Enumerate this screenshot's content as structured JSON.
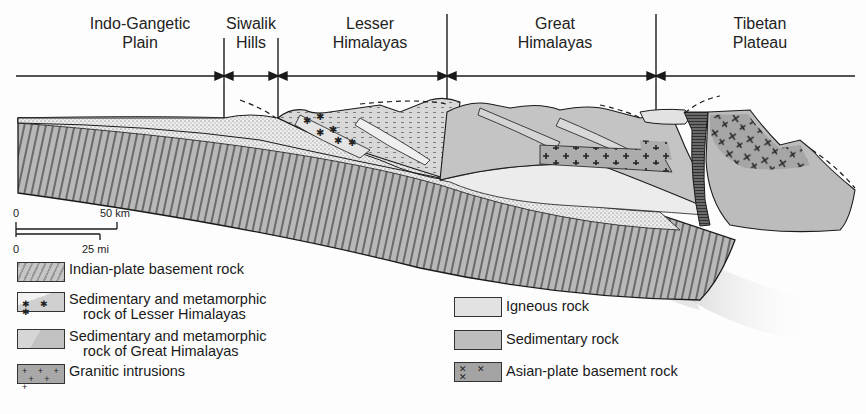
{
  "title_fragment": "Himalayan cross-section (title cut off at top edge)",
  "regions": [
    {
      "line1": "Indo-Gangetic",
      "line2": "Plain"
    },
    {
      "line1": "Siwalik",
      "line2": "Hills"
    },
    {
      "line1": "Lesser",
      "line2": "Himalayas"
    },
    {
      "line1": "Great",
      "line2": "Himalayas"
    },
    {
      "line1": "Tibetan",
      "line2": "Plateau"
    }
  ],
  "scale_bar": {
    "km_start": "0",
    "km_end": "50 km",
    "mi_start": "0",
    "mi_end": "25 mi"
  },
  "legend": {
    "left": [
      {
        "icon": "diagonal-hatch-swatch",
        "line1": "Indian-plate basement rock",
        "line2": ""
      },
      {
        "icon": "dotted-granite-swatch",
        "line1": "Sedimentary and metamorphic",
        "line2": "rock of Lesser Himalayas"
      },
      {
        "icon": "stippled-block-swatch",
        "line1": "Sedimentary and metamorphic",
        "line2": "rock of Great Himalayas"
      },
      {
        "icon": "cross-pattern-swatch",
        "line1": "Granitic intrusions",
        "line2": ""
      }
    ],
    "right": [
      {
        "icon": "light-gray-swatch",
        "line1": "Igneous rock"
      },
      {
        "icon": "mid-gray-swatch",
        "line1": "Sedimentary rock"
      },
      {
        "icon": "x-pattern-swatch",
        "line1": "Asian-plate basement rock"
      }
    ]
  },
  "colors": {
    "ink": "#1a1a1a",
    "indian_plate": "#b4b4b4",
    "lesser": "#e6e6e6",
    "great": "#c4c4c4",
    "igneous": "#e2e2e2",
    "sedimentary": "#bdbdbd",
    "asian_plate": "#a8a8a8",
    "suture": "#555555"
  }
}
